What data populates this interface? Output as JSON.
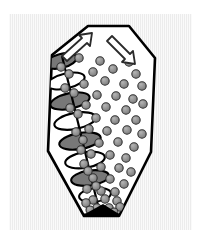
{
  "figure": {
    "background_color": "#ececec",
    "page_color": "#ffffff",
    "outline_color": "#000000",
    "vessel_fill_color": "#ffffff",
    "particle_fill_color": "#8f8f8f",
    "particle_stroke_color": "#303030",
    "flight_shaded_color": "#787878",
    "flight_light_color": "#ffffff",
    "outlet_color": "#000000"
  },
  "panel": {
    "x": 9,
    "y": 14,
    "width": 183,
    "height": 216
  },
  "vessel": {
    "name": "conical-vessel",
    "outline_points": "88,26 129,26 155,58 151,152 119,216 84,216 48,151 52,55",
    "stroke_width": 2.6
  },
  "arrows": [
    {
      "name": "arrow-up-right",
      "label": "",
      "direction": "up-right",
      "points": "62,56 82,38 79,35 92,33 90,46 87,43 67,61",
      "fill": "#ffffff",
      "stroke": "#2b2b2b"
    },
    {
      "name": "arrow-down-right",
      "label": "",
      "direction": "down-right",
      "points": "112,36 130,54 133,51 135,64 122,62 125,59 107,41",
      "fill": "#ffffff",
      "stroke": "#2b2b2b"
    }
  ],
  "screw": {
    "name": "helical-screw-auger",
    "shaft": {
      "x1": 62,
      "y1": 56,
      "x2": 100,
      "y2": 214
    },
    "flight_count": 8,
    "flights": [
      {
        "cx": 61,
        "cy": 61,
        "rx": 16,
        "ry": 7.0,
        "rot": -14,
        "shaded": true
      },
      {
        "cx": 66,
        "cy": 81,
        "rx": 19,
        "ry": 7.5,
        "rot": -13,
        "shaded": false
      },
      {
        "cx": 70,
        "cy": 101,
        "rx": 20,
        "ry": 7.8,
        "rot": -12,
        "shaded": true
      },
      {
        "cx": 75,
        "cy": 121,
        "rx": 21,
        "ry": 8.0,
        "rot": -11,
        "shaded": false
      },
      {
        "cx": 80,
        "cy": 141,
        "rx": 21,
        "ry": 8.0,
        "rot": -10,
        "shaded": true
      },
      {
        "cx": 85,
        "cy": 160,
        "rx": 20,
        "ry": 7.8,
        "rot": -9,
        "shaded": false
      },
      {
        "cx": 90,
        "cy": 178,
        "rx": 19,
        "ry": 7.5,
        "rot": -8,
        "shaded": true
      },
      {
        "cx": 95,
        "cy": 195,
        "rx": 16,
        "ry": 6.8,
        "rot": -7,
        "shaded": false
      }
    ]
  },
  "outlet": {
    "name": "bottom-outlet",
    "points": "85,214 119,214 103,204",
    "fill": "#000000"
  },
  "particles": {
    "radius_default": 4.2,
    "items": [
      {
        "cx": 79,
        "cy": 58,
        "r": 4.2
      },
      {
        "cx": 100,
        "cy": 61,
        "r": 4.2
      },
      {
        "cx": 129,
        "cy": 62,
        "r": 4.2
      },
      {
        "cx": 93,
        "cy": 72,
        "r": 4.2
      },
      {
        "cx": 113,
        "cy": 69,
        "r": 4.2
      },
      {
        "cx": 136,
        "cy": 74,
        "r": 4.2
      },
      {
        "cx": 69,
        "cy": 74,
        "r": 4.2
      },
      {
        "cx": 84,
        "cy": 84,
        "r": 4.2
      },
      {
        "cx": 105,
        "cy": 81,
        "r": 4.2
      },
      {
        "cx": 124,
        "cy": 84,
        "r": 4.2
      },
      {
        "cx": 142,
        "cy": 86,
        "r": 4.2
      },
      {
        "cx": 74,
        "cy": 93,
        "r": 4.2
      },
      {
        "cx": 97,
        "cy": 95,
        "r": 4.2
      },
      {
        "cx": 116,
        "cy": 96,
        "r": 4.2
      },
      {
        "cx": 133,
        "cy": 99,
        "r": 4.2
      },
      {
        "cx": 86,
        "cy": 105,
        "r": 4.2
      },
      {
        "cx": 106,
        "cy": 107,
        "r": 4.2
      },
      {
        "cx": 126,
        "cy": 110,
        "r": 4.2
      },
      {
        "cx": 143,
        "cy": 104,
        "r": 4.2
      },
      {
        "cx": 78,
        "cy": 114,
        "r": 4.2
      },
      {
        "cx": 96,
        "cy": 118,
        "r": 4.2
      },
      {
        "cx": 115,
        "cy": 120,
        "r": 4.2
      },
      {
        "cx": 136,
        "cy": 120,
        "r": 4.2
      },
      {
        "cx": 89,
        "cy": 129,
        "r": 4.2
      },
      {
        "cx": 107,
        "cy": 131,
        "r": 4.2
      },
      {
        "cx": 127,
        "cy": 130,
        "r": 4.2
      },
      {
        "cx": 142,
        "cy": 134,
        "r": 4.2
      },
      {
        "cx": 83,
        "cy": 140,
        "r": 4.2
      },
      {
        "cx": 99,
        "cy": 143,
        "r": 4.2
      },
      {
        "cx": 118,
        "cy": 142,
        "r": 4.2
      },
      {
        "cx": 134,
        "cy": 147,
        "r": 4.2
      },
      {
        "cx": 91,
        "cy": 154,
        "r": 4.2
      },
      {
        "cx": 110,
        "cy": 155,
        "r": 4.2
      },
      {
        "cx": 126,
        "cy": 158,
        "r": 4.2
      },
      {
        "cx": 84,
        "cy": 164,
        "r": 4.2
      },
      {
        "cx": 101,
        "cy": 167,
        "r": 4.2
      },
      {
        "cx": 119,
        "cy": 168,
        "r": 4.2
      },
      {
        "cx": 131,
        "cy": 172,
        "r": 4.2
      },
      {
        "cx": 93,
        "cy": 178,
        "r": 4.2
      },
      {
        "cx": 110,
        "cy": 179,
        "r": 4.2
      },
      {
        "cx": 124,
        "cy": 184,
        "r": 4.2
      },
      {
        "cx": 87,
        "cy": 189,
        "r": 4.2
      },
      {
        "cx": 101,
        "cy": 191,
        "r": 4.2
      },
      {
        "cx": 115,
        "cy": 192,
        "r": 4.2
      },
      {
        "cx": 93,
        "cy": 200,
        "r": 4.2
      },
      {
        "cx": 105,
        "cy": 199,
        "r": 4.2
      },
      {
        "cx": 117,
        "cy": 201,
        "r": 4.2
      },
      {
        "cx": 86,
        "cy": 203,
        "r": 4.2
      },
      {
        "cx": 97,
        "cy": 208,
        "r": 4.2
      },
      {
        "cx": 109,
        "cy": 208,
        "r": 4.2
      },
      {
        "cx": 120,
        "cy": 207,
        "r": 4.2
      },
      {
        "cx": 90,
        "cy": 210,
        "r": 4.0
      },
      {
        "cx": 114,
        "cy": 212,
        "r": 4.0
      },
      {
        "cx": 61,
        "cy": 67,
        "r": 4.2
      },
      {
        "cx": 65,
        "cy": 88,
        "r": 4.2
      },
      {
        "cx": 70,
        "cy": 108,
        "r": 4.2
      },
      {
        "cx": 76,
        "cy": 132,
        "r": 4.2
      },
      {
        "cx": 81,
        "cy": 150,
        "r": 4.2
      },
      {
        "cx": 88,
        "cy": 171,
        "r": 4.2
      },
      {
        "cx": 96,
        "cy": 186,
        "r": 4.2
      }
    ]
  }
}
